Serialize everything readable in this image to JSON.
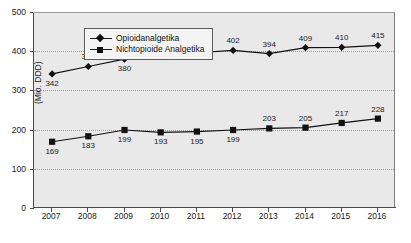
{
  "chart_data": {
    "type": "line",
    "title": "",
    "xlabel": "",
    "ylabel": "(Mio. DDD)",
    "categories": [
      "2007",
      "2008",
      "2009",
      "2010",
      "2011",
      "2012",
      "2013",
      "2014",
      "2015",
      "2016"
    ],
    "ylim": [
      0,
      500
    ],
    "yticks": [
      0,
      100,
      200,
      300,
      400,
      500
    ],
    "ytick_labels": [
      "0",
      "100",
      "200",
      "300",
      "400",
      "500"
    ],
    "grid": true,
    "grid_style": "dotted-horizontal",
    "legend_position": "top-left-inside",
    "series": [
      {
        "name": "Opioidanalgetika",
        "marker": "diamond",
        "color": "#111111",
        "values": [
          342,
          361,
          380,
          387,
          396,
          402,
          394,
          409,
          410,
          415
        ],
        "labels": [
          "342",
          "361",
          "380",
          "387",
          "396",
          "402",
          "394",
          "409",
          "410",
          "415"
        ]
      },
      {
        "name": "Nichtopioide Analgetika",
        "marker": "square",
        "color": "#111111",
        "values": [
          169,
          183,
          199,
          193,
          195,
          199,
          203,
          205,
          217,
          228
        ],
        "labels": [
          "169",
          "183",
          "199",
          "193",
          "195",
          "199",
          "203",
          "205",
          "217",
          "228"
        ]
      }
    ]
  },
  "legend": {
    "items": [
      {
        "label": "Opioidanalgetika",
        "marker": "diamond"
      },
      {
        "label": "Nichtopioide Analgetika",
        "marker": "square"
      }
    ]
  },
  "colors": {
    "plot_background": "#e9e9e9",
    "page_background": "#ffffff",
    "axis": "#4a4a4a",
    "gridline": "#9b9b9b",
    "series": "#111111",
    "legend_background": "#f4f4f4",
    "legend_border": "#5d5d5d",
    "text": "#1a1a1a"
  }
}
